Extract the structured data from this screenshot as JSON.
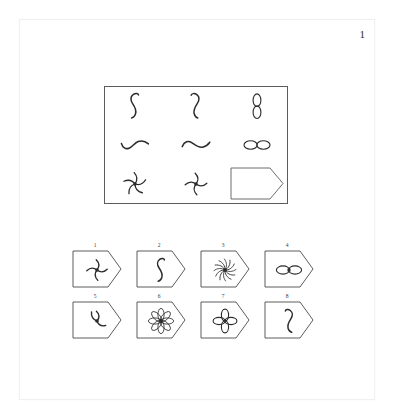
{
  "page": {
    "item_number": "1",
    "background_color": "#ffffff",
    "ink_color": "#2b2b2b",
    "border_color": "#5c5c5c"
  },
  "matrix": {
    "rows": 3,
    "columns": 3,
    "cells": [
      {
        "position": "r1c1",
        "glyph_name": "vertical-squiggle-s-curve",
        "kind": "figure",
        "filled": false
      },
      {
        "position": "r1c2",
        "glyph_name": "vertical-squiggle-reversed",
        "kind": "figure",
        "filled": false
      },
      {
        "position": "r1c3",
        "glyph_name": "vertical-figure-eight-two-lobes",
        "kind": "figure",
        "filled": false
      },
      {
        "position": "r2c1",
        "glyph_name": "horizontal-wave-thick-tail",
        "kind": "figure",
        "filled": false
      },
      {
        "position": "r2c2",
        "glyph_name": "horizontal-wave-tilde",
        "kind": "figure",
        "filled": false
      },
      {
        "position": "r2c3",
        "glyph_name": "horizontal-infinity-two-lobes",
        "kind": "figure",
        "filled": false
      },
      {
        "position": "r3c1",
        "glyph_name": "pinwheel-five-arms",
        "kind": "figure",
        "filled": false
      },
      {
        "position": "r3c2",
        "glyph_name": "pinwheel-four-arms",
        "kind": "figure",
        "filled": false
      },
      {
        "position": "r3c3",
        "glyph_name": "empty-answer-slot-tag-outline",
        "kind": "blank",
        "filled": false
      }
    ]
  },
  "options": {
    "count": 8,
    "shape_name": "tag-pentagon-outline",
    "rows": [
      [
        {
          "number": "1",
          "glyph_name": "pinwheel-four-arms"
        },
        {
          "number": "2",
          "glyph_name": "vertical-squiggle-s-curve"
        },
        {
          "number": "3",
          "glyph_name": "starburst-many-arms"
        },
        {
          "number": "4",
          "glyph_name": "horizontal-infinity-filled-center"
        }
      ],
      [
        {
          "number": "5",
          "glyph_name": "pinwheel-three-arms"
        },
        {
          "number": "6",
          "glyph_name": "rosette-eight-petals"
        },
        {
          "number": "7",
          "glyph_name": "clover-four-petals"
        },
        {
          "number": "8",
          "glyph_name": "vertical-squiggle-reversed"
        }
      ]
    ]
  }
}
